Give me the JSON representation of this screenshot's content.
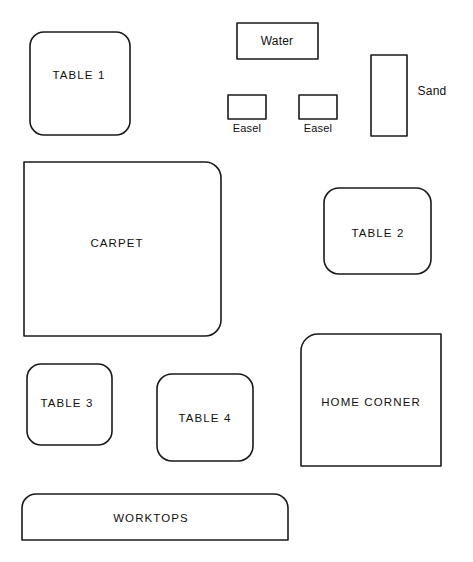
{
  "diagram": {
    "width": 473,
    "height": 562,
    "background_color": "#ffffff",
    "stroke_color": "#1a1a1a",
    "stroke_width": 1.6,
    "fill_color": "none",
    "text_color": "#111111"
  },
  "zones": [
    {
      "id": "table-1",
      "label": "TABLE 1",
      "shape": "rounded-rect",
      "x": 30,
      "y": 32,
      "w": 100,
      "h": 103,
      "radius": {
        "tl": 14,
        "tr": 14,
        "br": 14,
        "bl": 14
      },
      "label_x": 79,
      "label_y": 76,
      "label_style": "caps"
    },
    {
      "id": "water",
      "label": "Water",
      "shape": "rect",
      "x": 237,
      "y": 23,
      "w": 81,
      "h": 36,
      "radius": {
        "tl": 0,
        "tr": 0,
        "br": 0,
        "bl": 0
      },
      "label_x": 277,
      "label_y": 41,
      "label_style": "mixed"
    },
    {
      "id": "easel-1",
      "label": "Easel",
      "shape": "rect",
      "x": 228,
      "y": 95,
      "w": 38,
      "h": 24,
      "radius": {
        "tl": 0,
        "tr": 0,
        "br": 0,
        "bl": 0
      },
      "label_x": 247,
      "label_y": 128,
      "label_style": "small",
      "label_position": "below"
    },
    {
      "id": "easel-2",
      "label": "Easel",
      "shape": "rect",
      "x": 299,
      "y": 95,
      "w": 38,
      "h": 24,
      "radius": {
        "tl": 0,
        "tr": 0,
        "br": 0,
        "bl": 0
      },
      "label_x": 318,
      "label_y": 128,
      "label_style": "small",
      "label_position": "below"
    },
    {
      "id": "sand",
      "label": "Sand",
      "shape": "rect",
      "x": 371,
      "y": 55,
      "w": 36,
      "h": 81,
      "radius": {
        "tl": 0,
        "tr": 0,
        "br": 0,
        "bl": 0
      },
      "label_x": 432,
      "label_y": 91,
      "label_style": "mixed",
      "label_position": "right"
    },
    {
      "id": "carpet",
      "label": "CARPET",
      "shape": "rounded-rect",
      "x": 24,
      "y": 162,
      "w": 197,
      "h": 174,
      "radius": {
        "tl": 0,
        "tr": 16,
        "br": 16,
        "bl": 0
      },
      "label_x": 117,
      "label_y": 244,
      "label_style": "caps"
    },
    {
      "id": "table-2",
      "label": "TABLE 2",
      "shape": "rounded-rect",
      "x": 324,
      "y": 188,
      "w": 107,
      "h": 86,
      "radius": {
        "tl": 15,
        "tr": 15,
        "br": 15,
        "bl": 15
      },
      "label_x": 378,
      "label_y": 234,
      "label_style": "caps"
    },
    {
      "id": "table-3",
      "label": "TABLE 3",
      "shape": "rounded-rect",
      "x": 27,
      "y": 364,
      "w": 85,
      "h": 81,
      "radius": {
        "tl": 14,
        "tr": 14,
        "br": 14,
        "bl": 14
      },
      "label_x": 67,
      "label_y": 404,
      "label_style": "caps"
    },
    {
      "id": "table-4",
      "label": "TABLE 4",
      "shape": "rounded-rect",
      "x": 157,
      "y": 374,
      "w": 96,
      "h": 87,
      "radius": {
        "tl": 15,
        "tr": 15,
        "br": 15,
        "bl": 15
      },
      "label_x": 205,
      "label_y": 419,
      "label_style": "caps"
    },
    {
      "id": "home-corner",
      "label": "HOME CORNER",
      "shape": "rounded-rect",
      "x": 301,
      "y": 334,
      "w": 140,
      "h": 132,
      "radius": {
        "tl": 17,
        "tr": 0,
        "br": 0,
        "bl": 0
      },
      "label_x": 371,
      "label_y": 403,
      "label_style": "caps"
    },
    {
      "id": "worktops",
      "label": "WORKTOPS",
      "shape": "rounded-rect",
      "x": 22,
      "y": 494,
      "w": 266,
      "h": 46,
      "radius": {
        "tl": 14,
        "tr": 14,
        "br": 0,
        "bl": 0
      },
      "label_x": 151,
      "label_y": 519,
      "label_style": "caps"
    }
  ]
}
